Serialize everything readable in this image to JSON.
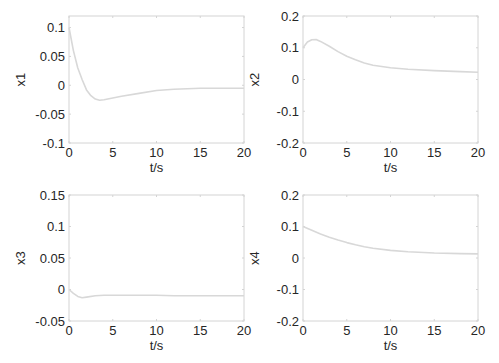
{
  "figure": {
    "line_color": "#d8d8d8",
    "frame_color": "#d4d4d4"
  },
  "chart_data": [
    {
      "type": "line",
      "ylabel": "x1",
      "xlabel": "t/s",
      "xlim": [
        0,
        20
      ],
      "ylim": [
        -0.1,
        0.12
      ],
      "xticks": [
        "0",
        "5",
        "10",
        "15",
        "20"
      ],
      "yticks": [
        "0.1",
        "0.05",
        "0",
        "-0.05",
        "-0.1"
      ],
      "ytick_values": [
        0.1,
        0.05,
        0,
        -0.05,
        -0.1
      ],
      "grid": false,
      "x": [
        0,
        0.5,
        1,
        1.5,
        2,
        2.5,
        3,
        3.5,
        4,
        5,
        6,
        8,
        10,
        12,
        15,
        18,
        20
      ],
      "values": [
        0.1,
        0.06,
        0.03,
        0.01,
        -0.008,
        -0.018,
        -0.024,
        -0.026,
        -0.025,
        -0.022,
        -0.019,
        -0.014,
        -0.009,
        -0.007,
        -0.005,
        -0.005,
        -0.005
      ]
    },
    {
      "type": "line",
      "ylabel": "x2",
      "xlabel": "t/s",
      "xlim": [
        0,
        20
      ],
      "ylim": [
        -0.2,
        0.2
      ],
      "xticks": [
        "0",
        "5",
        "10",
        "15",
        "20"
      ],
      "yticks": [
        "0.2",
        "0.1",
        "0",
        "-0.1",
        "-0.2"
      ],
      "ytick_values": [
        0.2,
        0.1,
        0,
        -0.1,
        -0.2
      ],
      "grid": false,
      "x": [
        0,
        0.5,
        1,
        1.5,
        2,
        3,
        4,
        5,
        6,
        7,
        8,
        10,
        12,
        15,
        18,
        20
      ],
      "values": [
        0.1,
        0.118,
        0.125,
        0.126,
        0.12,
        0.105,
        0.088,
        0.073,
        0.062,
        0.052,
        0.045,
        0.037,
        0.032,
        0.028,
        0.025,
        0.023
      ]
    },
    {
      "type": "line",
      "ylabel": "x3",
      "xlabel": "t/s",
      "xlim": [
        0,
        20
      ],
      "ylim": [
        -0.05,
        0.15
      ],
      "xticks": [
        "0",
        "5",
        "10",
        "15",
        "20"
      ],
      "yticks": [
        "0.15",
        "0.1",
        "0.05",
        "0",
        "-0.05"
      ],
      "ytick_values": [
        0.15,
        0.1,
        0.05,
        0,
        -0.05
      ],
      "grid": false,
      "x": [
        0,
        0.5,
        1,
        1.5,
        2,
        3,
        4,
        5,
        8,
        10,
        12,
        15,
        20
      ],
      "values": [
        0.0,
        -0.006,
        -0.011,
        -0.013,
        -0.012,
        -0.01,
        -0.009,
        -0.009,
        -0.009,
        -0.009,
        -0.01,
        -0.01,
        -0.01
      ]
    },
    {
      "type": "line",
      "ylabel": "x4",
      "xlabel": "t/s",
      "xlim": [
        0,
        20
      ],
      "ylim": [
        -0.2,
        0.2
      ],
      "xticks": [
        "0",
        "5",
        "10",
        "15",
        "20"
      ],
      "yticks": [
        "0.2",
        "0.1",
        "0",
        "-0.1",
        "-0.2"
      ],
      "ytick_values": [
        0.2,
        0.1,
        0,
        -0.1,
        -0.2
      ],
      "grid": false,
      "x": [
        0,
        1,
        2,
        3,
        4,
        5,
        6,
        7,
        8,
        10,
        12,
        15,
        18,
        20
      ],
      "values": [
        0.1,
        0.088,
        0.076,
        0.066,
        0.057,
        0.049,
        0.042,
        0.036,
        0.031,
        0.024,
        0.02,
        0.016,
        0.014,
        0.013
      ]
    }
  ]
}
